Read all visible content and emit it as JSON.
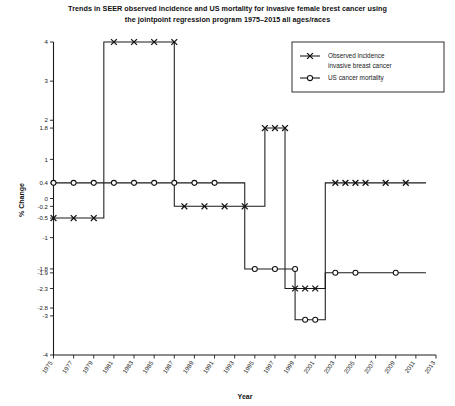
{
  "chart_data": {
    "type": "line",
    "title": "Trends in SEER observed incidence and US mortality for invasive female brest cancer using the jointpoint regression program 1975–2015 all ages/races",
    "title_lines": [
      "Trends in SEER observed incidence and US mortality for invasive female brest cancer using",
      "the jointpoint regression program 1975–2015 all ages/races"
    ],
    "xlabel": "Year",
    "ylabel": "% Change",
    "xlim": [
      1975,
      2013
    ],
    "ylim": [
      -4,
      4
    ],
    "grid": false,
    "legend_position": "top-right",
    "xticks": [
      1975,
      1977,
      1979,
      1981,
      1983,
      1985,
      1987,
      1989,
      1991,
      1993,
      1995,
      1997,
      1999,
      2001,
      2003,
      2005,
      2007,
      2009,
      2011,
      2013
    ],
    "xticklabels": [
      "1975",
      "1977",
      "1979",
      "1981",
      "1983",
      "1985",
      "1987",
      "1989",
      "1991",
      "1993",
      "1995",
      "1997",
      "1999",
      "2001",
      "2003",
      "2005",
      "2007",
      "2009",
      "2011",
      "2013"
    ],
    "yticks": [
      4,
      3,
      2,
      1.8,
      1,
      0.4,
      0,
      -0.2,
      -0.5,
      -1,
      -1.8,
      -1.9,
      -2.3,
      -2.8,
      -3,
      -4
    ],
    "yticklabels": [
      "4",
      "3",
      "2",
      "1.8",
      "1",
      "0.4",
      "0",
      "-0.2",
      "-0.5",
      "-1",
      "-1.8",
      "-1.9",
      "-2.3",
      "-2.8",
      "-3",
      "-4"
    ],
    "series": [
      {
        "name": "Observed incidence invasive breast cancer",
        "marker": "x",
        "style": "step",
        "segments": [
          {
            "x_start": 1975,
            "x_end": 1980,
            "value": -0.5
          },
          {
            "x_start": 1980,
            "x_end": 1987,
            "value": 4
          },
          {
            "x_start": 1987,
            "x_end": 1996,
            "value": -0.2
          },
          {
            "x_start": 1996,
            "x_end": 1998,
            "value": 1.8
          },
          {
            "x_start": 1998,
            "x_end": 2002,
            "value": -2.3
          },
          {
            "x_start": 2002,
            "x_end": 2012,
            "value": 0.4
          }
        ],
        "markers": [
          {
            "x": 1975,
            "y": -0.5
          },
          {
            "x": 1977,
            "y": -0.5
          },
          {
            "x": 1979,
            "y": -0.5
          },
          {
            "x": 1981,
            "y": 4
          },
          {
            "x": 1983,
            "y": 4
          },
          {
            "x": 1985,
            "y": 4
          },
          {
            "x": 1987,
            "y": 4
          },
          {
            "x": 1988,
            "y": -0.2
          },
          {
            "x": 1990,
            "y": -0.2
          },
          {
            "x": 1992,
            "y": -0.2
          },
          {
            "x": 1994,
            "y": -0.2
          },
          {
            "x": 1996,
            "y": 1.8
          },
          {
            "x": 1997,
            "y": 1.8
          },
          {
            "x": 1998,
            "y": 1.8
          },
          {
            "x": 1999,
            "y": -2.3
          },
          {
            "x": 2000,
            "y": -2.3
          },
          {
            "x": 2001,
            "y": -2.3
          },
          {
            "x": 2003,
            "y": 0.4
          },
          {
            "x": 2004,
            "y": 0.4
          },
          {
            "x": 2005,
            "y": 0.4
          },
          {
            "x": 2006,
            "y": 0.4
          },
          {
            "x": 2008,
            "y": 0.4
          },
          {
            "x": 2010,
            "y": 0.4
          }
        ]
      },
      {
        "name": "US cancer mortality",
        "marker": "o",
        "style": "step",
        "segments": [
          {
            "x_start": 1975,
            "x_end": 1994,
            "value": 0.4
          },
          {
            "x_start": 1994,
            "x_end": 1999,
            "value": -1.8
          },
          {
            "x_start": 1999,
            "x_end": 2002,
            "value": -3.1
          },
          {
            "x_start": 2002,
            "x_end": 2012,
            "value": -1.9
          }
        ],
        "markers": [
          {
            "x": 1975,
            "y": 0.4
          },
          {
            "x": 1977,
            "y": 0.4
          },
          {
            "x": 1979,
            "y": 0.4
          },
          {
            "x": 1981,
            "y": 0.4
          },
          {
            "x": 1983,
            "y": 0.4
          },
          {
            "x": 1985,
            "y": 0.4
          },
          {
            "x": 1987,
            "y": 0.4
          },
          {
            "x": 1989,
            "y": 0.4
          },
          {
            "x": 1991,
            "y": 0.4
          },
          {
            "x": 1995,
            "y": -1.8
          },
          {
            "x": 1997,
            "y": -1.8
          },
          {
            "x": 1999,
            "y": -1.8
          },
          {
            "x": 2000,
            "y": -3.1
          },
          {
            "x": 2001,
            "y": -3.1
          },
          {
            "x": 2003,
            "y": -1.9
          },
          {
            "x": 2005,
            "y": -1.9
          },
          {
            "x": 2009,
            "y": -1.9
          }
        ]
      }
    ],
    "legend": [
      {
        "label_lines": [
          "Observed incidence",
          "invasive breast cancer"
        ],
        "marker": "x"
      },
      {
        "label_lines": [
          "US cancer mortality"
        ],
        "marker": "o"
      }
    ],
    "colors": {
      "line": "#1a1a1a",
      "marker": "#111111",
      "background": "#ffffff",
      "axis": "#1a1a1a"
    }
  }
}
